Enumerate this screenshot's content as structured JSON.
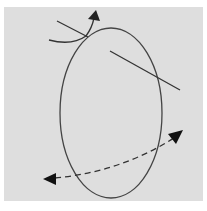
{
  "figure": {
    "colors": {
      "background": "#dedede",
      "margin": "#ffffff",
      "stroke": "#333333"
    },
    "elements": [
      {
        "id": "ellipse",
        "type": "ellipse",
        "cx": 111,
        "cy": 113,
        "rx": 51,
        "ry": 85
      },
      {
        "id": "axis-line",
        "type": "line",
        "from": [
          110,
          51
        ],
        "to": [
          180,
          90
        ]
      },
      {
        "id": "top-tangent-line",
        "type": "line",
        "from": [
          57,
          21
        ],
        "to": [
          88,
          37
        ]
      },
      {
        "id": "rotation-arrow",
        "type": "curved-arrow",
        "direction": "up"
      },
      {
        "id": "dashed-double-arrow",
        "type": "dashed-curved-double-arrow",
        "from": [
          47,
          179
        ],
        "to": [
          182,
          132
        ]
      }
    ],
    "caption": ""
  }
}
